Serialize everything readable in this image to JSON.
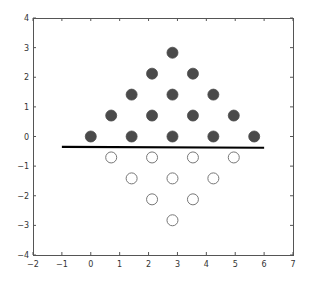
{
  "chart_data": {
    "type": "scatter",
    "title": "",
    "xlabel": "",
    "ylabel": "",
    "xlim": [
      -2,
      7
    ],
    "ylim": [
      -4,
      4
    ],
    "xticks": [
      -2,
      -1,
      0,
      1,
      2,
      3,
      4,
      5,
      6,
      7
    ],
    "yticks": [
      -4,
      -3,
      -2,
      -1,
      0,
      1,
      2,
      3,
      4
    ],
    "xtick_labels": [
      "−2",
      "−1",
      "0",
      "1",
      "2",
      "3",
      "4",
      "5",
      "6",
      "7"
    ],
    "ytick_labels": [
      "−4",
      "−3",
      "−2",
      "−1",
      "0",
      "1",
      "2",
      "3",
      "4"
    ],
    "grid": false,
    "legend": null,
    "series": [
      {
        "name": "filled",
        "marker": "filled-circle",
        "color": "#4a4a4a",
        "points": [
          [
            0.0,
            0.0
          ],
          [
            1.414,
            0.0
          ],
          [
            2.828,
            0.0
          ],
          [
            4.243,
            0.0
          ],
          [
            5.657,
            0.0
          ],
          [
            0.707,
            0.707
          ],
          [
            2.121,
            0.707
          ],
          [
            3.536,
            0.707
          ],
          [
            4.95,
            0.707
          ],
          [
            1.414,
            1.414
          ],
          [
            2.828,
            1.414
          ],
          [
            4.243,
            1.414
          ],
          [
            2.121,
            2.121
          ],
          [
            3.536,
            2.121
          ],
          [
            2.828,
            2.828
          ]
        ]
      },
      {
        "name": "open",
        "marker": "open-circle",
        "color": "#777777",
        "points": [
          [
            0.707,
            -0.707
          ],
          [
            2.121,
            -0.707
          ],
          [
            3.536,
            -0.707
          ],
          [
            4.95,
            -0.707
          ],
          [
            1.414,
            -1.414
          ],
          [
            2.828,
            -1.414
          ],
          [
            4.243,
            -1.414
          ],
          [
            2.121,
            -2.121
          ],
          [
            3.536,
            -2.121
          ],
          [
            2.828,
            -2.828
          ]
        ]
      },
      {
        "name": "separator-line",
        "marker": "line",
        "color": "#000000",
        "points": [
          [
            -1,
            -0.35
          ],
          [
            6,
            -0.38
          ]
        ]
      }
    ]
  },
  "layout": {
    "plot_left": 33,
    "plot_top": 18,
    "plot_right": 293,
    "plot_bottom": 255,
    "marker_radius": 5.5
  }
}
